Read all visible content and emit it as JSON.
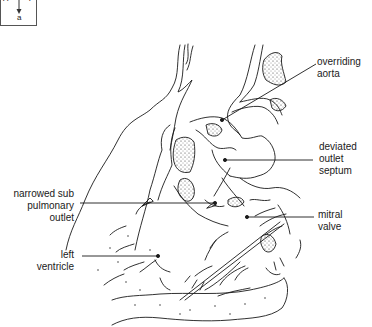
{
  "orientation": {
    "left": "A",
    "right": "P",
    "bottom": "a"
  },
  "labels": [
    {
      "id": "overriding-aorta",
      "lines": [
        "overriding",
        "aorta"
      ]
    },
    {
      "id": "deviated-outlet-septum",
      "lines": [
        "deviated",
        "outlet",
        "septum"
      ]
    },
    {
      "id": "narrowed-sub-pulmonary-outlet",
      "lines": [
        "narrowed sub",
        "pulmonary",
        "outlet"
      ]
    },
    {
      "id": "mitral-valve",
      "lines": [
        "mitral",
        "valve"
      ]
    },
    {
      "id": "left-ventricle",
      "lines": [
        "left",
        "ventricle"
      ]
    }
  ],
  "colors": {
    "line": "#1a1a1a",
    "background": "#ffffff"
  }
}
